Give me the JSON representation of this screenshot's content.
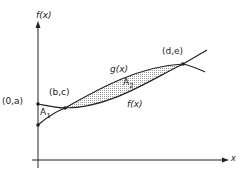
{
  "diagram": {
    "type": "area-between-curves",
    "axes": {
      "y_label": "f(x)",
      "x_label": "x"
    },
    "curves": [
      {
        "name": "g(x)",
        "label": "g(x)",
        "description": "upper concave curve from (0,a) through (b,c) to (d,e)"
      },
      {
        "name": "f(x)",
        "label": "f(x)",
        "description": "lower curve starting on y-axis below (0,a), crossing g at (b,c) and (d,e)"
      }
    ],
    "points": [
      {
        "label": "(0,a)"
      },
      {
        "label": "(b,c)"
      },
      {
        "label": "(d,e)"
      }
    ],
    "regions": [
      {
        "label": "A",
        "subscript": "1",
        "shaded": false
      },
      {
        "label": "A",
        "subscript": "2",
        "shaded": true
      }
    ]
  },
  "colors": {
    "ink": "#222222",
    "shade": "#cfcfcf"
  }
}
